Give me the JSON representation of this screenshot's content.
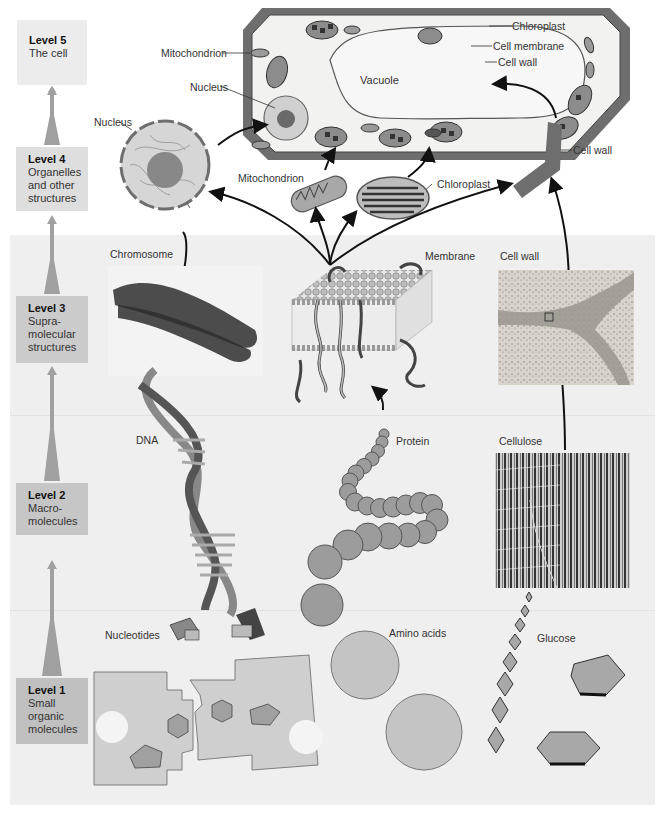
{
  "levels": [
    {
      "id": "level-5",
      "title": "Level 5",
      "desc": "The cell"
    },
    {
      "id": "level-4",
      "title": "Level 4",
      "desc": "Organelles and other structures"
    },
    {
      "id": "level-3",
      "title": "Level 3",
      "desc": "Supra-molecular structures"
    },
    {
      "id": "level-2",
      "title": "Level 2",
      "desc": "Macro-molecules"
    },
    {
      "id": "level-1",
      "title": "Level 1",
      "desc": "Small organic molecules"
    }
  ],
  "level_lines": {
    "l5": [
      "Level 5",
      "The cell"
    ],
    "l4": [
      "Level 4",
      "Organelles",
      "and other",
      "structures"
    ],
    "l3": [
      "Level 3",
      "Supra-",
      "molecular",
      "structures"
    ],
    "l2": [
      "Level 2",
      "Macro-",
      "molecules"
    ],
    "l1": [
      "Level 1",
      "Small",
      "organic",
      "molecules"
    ]
  },
  "cell_labels": {
    "chloroplast": "Chloroplast",
    "cell_membrane": "Cell membrane",
    "cell_wall": "Cell wall",
    "mitochondrion": "Mitochondrion",
    "nucleus": "Nucleus",
    "vacuole": "Vacuole"
  },
  "organelle_labels": {
    "nucleus": "Nucleus",
    "mitochondrion": "Mitochondrion",
    "chloroplast": "Chloroplast",
    "cell_wall": "Cell wall"
  },
  "supramolecular_labels": {
    "chromosome": "Chromosome",
    "membrane": "Membrane",
    "cell_wall": "Cell wall"
  },
  "macromolecule_labels": {
    "dna": "DNA",
    "protein": "Protein",
    "cellulose": "Cellulose"
  },
  "small_molecule_labels": {
    "nucleotides": "Nucleotides",
    "amino_acids": "Amino acids",
    "glucose": "Glucose"
  },
  "colors": {
    "panel_bg": "#efefef",
    "cell_wall": "#6e6e6e",
    "organelle_fill": "#9a9a9a",
    "molecule_fill": "#a8a8a8",
    "arrow": "#111111"
  }
}
